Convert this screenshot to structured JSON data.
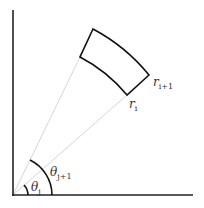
{
  "diagram": {
    "labels": {
      "r_inner": "r",
      "r_inner_sub": "i",
      "r_outer": "r",
      "r_outer_sub": "i+1",
      "theta_lower": "θ",
      "theta_lower_sub": "j",
      "theta_upper": "θ",
      "theta_upper_sub": "j+1"
    },
    "colors": {
      "axis": "#222222",
      "cell_outline": "#111111",
      "ray": "#d6d6d6",
      "text": "#333333"
    }
  }
}
